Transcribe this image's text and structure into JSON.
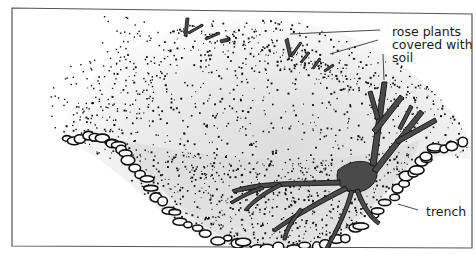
{
  "figure": {
    "labels": {
      "rose_plants": [
        "rose plants",
        "covered with",
        "soil"
      ],
      "trench": "trench"
    }
  },
  "colors": {
    "frame": "#555555",
    "ink": "#111111",
    "stem_fill": "#4a4a4a",
    "soil_shade": "#e6e6e6",
    "leader": "#333333"
  }
}
